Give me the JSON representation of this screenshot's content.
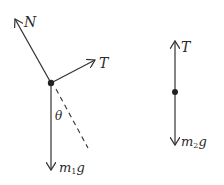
{
  "figure": {
    "left_body": {
      "forces": [
        {
          "id": "normal",
          "label": "N"
        },
        {
          "id": "tension",
          "label": "T"
        },
        {
          "id": "weight",
          "label_main": "m",
          "label_sub": "1",
          "label_tail": "g"
        }
      ],
      "angle_label": "θ"
    },
    "right_body": {
      "forces": [
        {
          "id": "tension",
          "label": "T"
        },
        {
          "id": "weight",
          "label_main": "m",
          "label_sub": "2",
          "label_tail": "g"
        }
      ]
    },
    "colors": {
      "stroke": "#333333",
      "dot": "#222222",
      "background": "#ffffff"
    }
  }
}
